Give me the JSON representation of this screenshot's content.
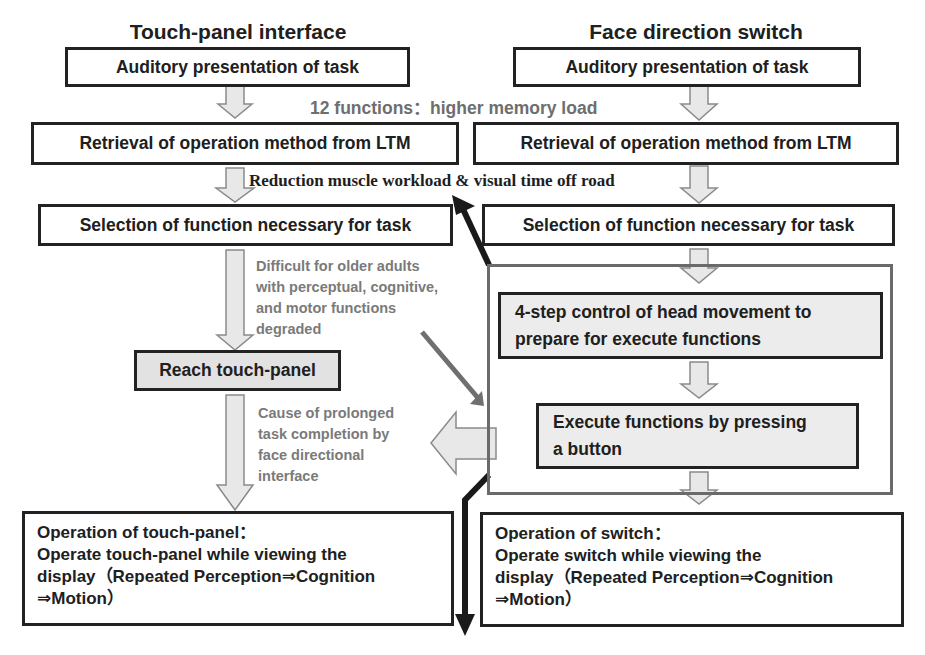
{
  "columns": {
    "left": {
      "title": "Touch-panel interface",
      "steps": {
        "auditory": "Auditory presentation of task",
        "retrieval": "Retrieval of operation method from LTM",
        "selection": "Selection of function necessary for task",
        "reach": "Reach touch-panel",
        "operation_heading": "Operation of touch-panel：",
        "operation_line1": "Operate touch-panel while viewing the",
        "operation_line2": "display（Repeated Perception⇒Cognition",
        "operation_line3": "⇒Motion）"
      }
    },
    "right": {
      "title": "Face direction switch",
      "steps": {
        "auditory": "Auditory presentation of task",
        "retrieval": "Retrieval of operation method from LTM",
        "selection": "Selection of function necessary for task",
        "head_control_line1": "4-step control of head movement to",
        "head_control_line2": "prepare for execute functions",
        "execute_line1": "Execute functions by pressing",
        "execute_line2": "a button",
        "operation_heading": "Operation of switch：",
        "operation_line1": "Operate switch while viewing the",
        "operation_line2": "display（Repeated Perception⇒Cognition",
        "operation_line3": "⇒Motion）"
      }
    }
  },
  "annotations": {
    "memory_load": "12 functions：higher memory load",
    "reduction": "Reduction muscle workload & visual time off road",
    "difficult_line1": "Difficult for older adults",
    "difficult_line2": "with perceptual, cognitive,",
    "difficult_line3": "and motor functions",
    "difficult_line4": "degraded",
    "cause_line1": "Cause of prolonged",
    "cause_line2": "task completion by",
    "cause_line3": "face directional",
    "cause_line4": "interface"
  },
  "colors": {
    "box_border": "#222222",
    "note_gray": "#7a7a7a",
    "arrow_fill": "#e6e6e6",
    "arrow_outline": "#8a8a8a",
    "dark_arrow": "#1a1a1a",
    "gray_arrow": "#6f6f6f",
    "highlight_box": "#e2e2e2"
  }
}
